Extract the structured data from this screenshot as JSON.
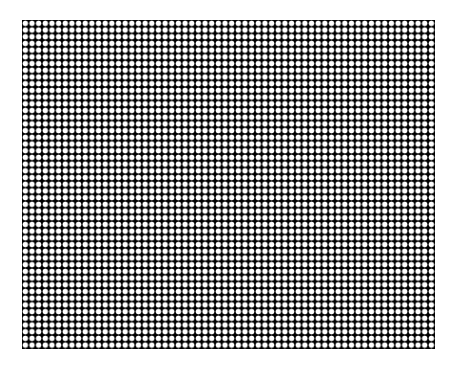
{
  "figure": {
    "type": "dot-grid-pattern",
    "grid": {
      "columns": 62,
      "rows": 49,
      "background_color": "#000000",
      "dot_color": "#ffffff",
      "dot_shape": "circle"
    }
  }
}
